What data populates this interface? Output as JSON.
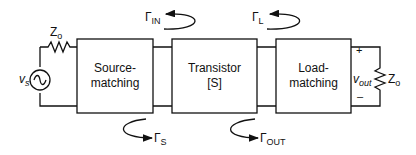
{
  "blocks": {
    "source": {
      "line1": "Source-",
      "line2": "matching"
    },
    "transistor": {
      "line1": "Transistor",
      "line2": "[S]"
    },
    "load": {
      "line1": "Load-",
      "line2": "matching"
    }
  },
  "labels": {
    "source_impedance": {
      "main": "Z",
      "sub": "o"
    },
    "load_impedance": {
      "main": "Z",
      "sub": "o"
    },
    "source_voltage": {
      "main": "v",
      "sub": "s"
    },
    "output_voltage": {
      "main": "v",
      "sub": "out"
    },
    "plus": "+",
    "minus": "–"
  },
  "reflection_coefficients": {
    "gamma_in": {
      "symbol": "Γ",
      "sub": "IN"
    },
    "gamma_l": {
      "symbol": "Γ",
      "sub": "L"
    },
    "gamma_s": {
      "symbol": "Γ",
      "sub": "S"
    },
    "gamma_out": {
      "symbol": "Γ",
      "sub": "OUT"
    }
  }
}
